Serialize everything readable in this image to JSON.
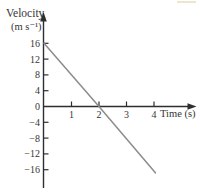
{
  "figure": {
    "background": "#ffffff",
    "colors": {
      "axis": "#2e2e2e",
      "line": "#8c8c8c",
      "text": "#353535",
      "artifact": "#eadfc6"
    },
    "y_axis": {
      "title": "Velocity",
      "unit": "(m s⁻¹)"
    },
    "x_axis": {
      "title": "Time (s)"
    }
  },
  "chart_data": {
    "type": "line",
    "title": "",
    "xlabel": "Time (s)",
    "ylabel": "Velocity (m s⁻¹)",
    "x_ticks": [
      1,
      2,
      3,
      4
    ],
    "y_ticks": [
      16,
      12,
      8,
      4,
      0,
      -4,
      -8,
      -12,
      -16
    ],
    "xlim": [
      0,
      4.6
    ],
    "ylim": [
      -18,
      18
    ],
    "grid": false,
    "legend": false,
    "series": [
      {
        "name": "velocity-line",
        "color": "#8c8c8c",
        "points": [
          {
            "t": 0,
            "v": 16
          },
          {
            "t": 2,
            "v": 0
          },
          {
            "t": 4.05,
            "v": -16.8
          }
        ]
      }
    ]
  }
}
